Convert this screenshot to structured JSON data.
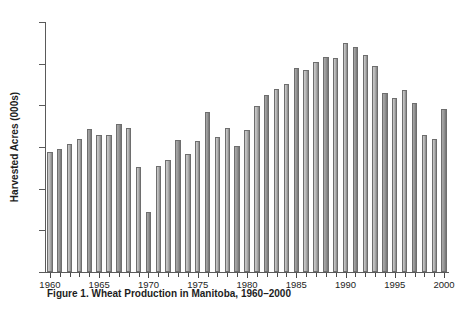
{
  "figure": {
    "caption": "Figure 1. Wheat Production in Manitoba, 1960–2000"
  },
  "chart_data": {
    "type": "bar",
    "title": "Figure 1. Wheat Production in Manitoba, 1960–2000",
    "xlabel": "",
    "ylabel": "Harvested Acres (000s)",
    "ylim": [
      0,
      6000
    ],
    "xlim": [
      1960,
      2000
    ],
    "grid": false,
    "legend": null,
    "ytick_labels": [
      "0",
      "1000",
      "2000",
      "3000",
      "4000",
      "5000",
      "6000"
    ],
    "ytick_values": [
      0,
      1000,
      2000,
      3000,
      4000,
      5000,
      6000
    ],
    "xtick_labels": [
      "1960",
      "1965",
      "1970",
      "1975",
      "1980",
      "1985",
      "1990",
      "1995",
      "2000"
    ],
    "xtick_values": [
      1960,
      1965,
      1970,
      1975,
      1980,
      1985,
      1990,
      1995,
      2000
    ],
    "bar_color": "#b0b0b0",
    "bar_edge_color": "#6e6e6e",
    "categories": [
      "1960",
      "1961",
      "1962",
      "1963",
      "1964",
      "1965",
      "1966",
      "1967",
      "1968",
      "1969",
      "1970",
      "1971",
      "1972",
      "1973",
      "1974",
      "1975",
      "1976",
      "1977",
      "1978",
      "1979",
      "1980",
      "1981",
      "1982",
      "1983",
      "1984",
      "1985",
      "1986",
      "1987",
      "1988",
      "1989",
      "1990",
      "1991",
      "1992",
      "1993",
      "1994",
      "1995",
      "1996",
      "1997",
      "1998",
      "1999",
      "2000"
    ],
    "values": [
      2880,
      2960,
      3080,
      3200,
      3440,
      3290,
      3300,
      3560,
      3450,
      2520,
      1440,
      2540,
      2700,
      3160,
      2830,
      3140,
      3850,
      3250,
      3450,
      3020,
      3400,
      3980,
      4250,
      4400,
      4520,
      4900,
      4840,
      5050,
      5150,
      5130,
      5500,
      5400,
      5200,
      4940,
      4300,
      4180,
      4380,
      4060,
      3300,
      3190,
      3920
    ]
  }
}
